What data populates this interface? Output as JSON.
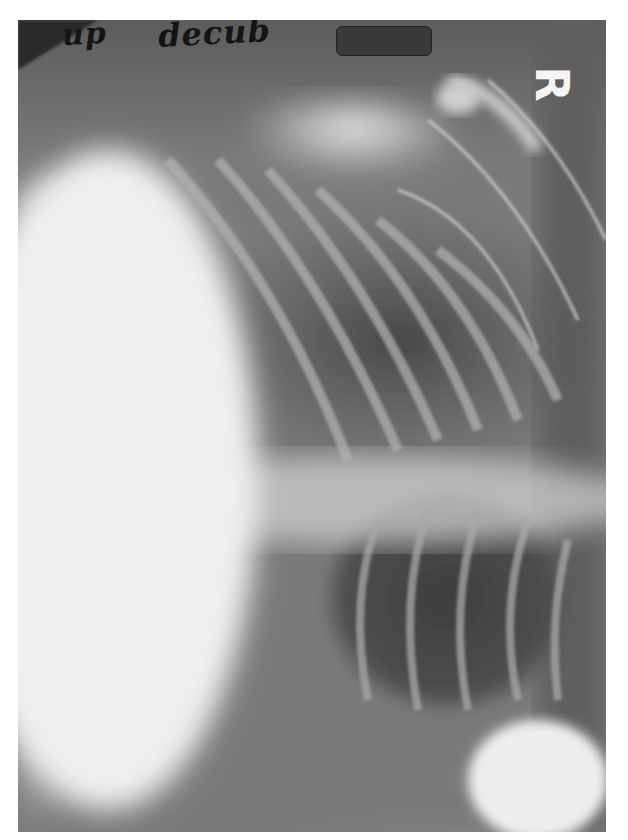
{
  "image": {
    "type": "radiograph",
    "description": "Chest X-ray, decubitus view",
    "annotations": {
      "handwritten_1": "up",
      "handwritten_2": "decub",
      "side_marker": "R",
      "redaction": ""
    },
    "colors": {
      "background": "#ffffff",
      "film_dark": "#3c3c3c",
      "film_mid": "#8a8a8a",
      "film_bright": "#f0f0f0",
      "marker": "#f4f4f4",
      "ink": "#141414"
    }
  }
}
